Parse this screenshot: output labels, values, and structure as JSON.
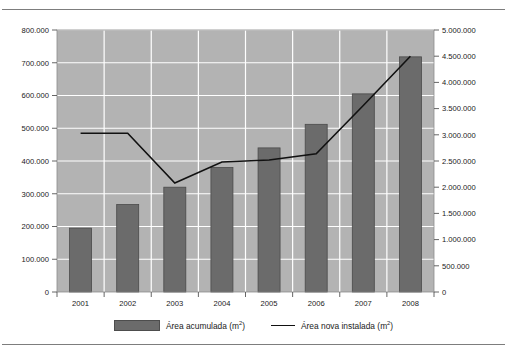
{
  "chart_data": {
    "type": "bar",
    "title": "",
    "subtitle": "",
    "xlabel": "",
    "ylabel": "",
    "grid": true,
    "legend_position": "bottom",
    "categories": [
      "2001",
      "2002",
      "2003",
      "2004",
      "2005",
      "2006",
      "2007",
      "2008"
    ],
    "series": [
      {
        "name": "Área acumulada (m²)",
        "type": "bar",
        "axis": "left",
        "color": "#6b6b6b",
        "values": [
          195000,
          267000,
          320000,
          380000,
          440000,
          512000,
          605000,
          718000
        ]
      },
      {
        "name": "Área nova instalada (m²)",
        "type": "line",
        "axis": "right",
        "color": "#111111",
        "values": [
          3030000,
          3030000,
          2080000,
          2480000,
          2520000,
          2640000,
          3560000,
          4500000
        ]
      }
    ],
    "left_axis": {
      "min": 0,
      "max": 800000,
      "step": 100000,
      "ticks": [
        "0",
        "100.000",
        "200.000",
        "300.000",
        "400.000",
        "500.000",
        "600.000",
        "700.000",
        "800.000"
      ]
    },
    "right_axis": {
      "min": 0,
      "max": 5000000,
      "step": 500000,
      "ticks": [
        "0",
        "500.000",
        "1.000.000",
        "1.500.000",
        "2.000.000",
        "2.500.000",
        "3.000.000",
        "3.500.000",
        "4.000.000",
        "4.500.000",
        "5.000.000"
      ]
    },
    "plot_background": "#b3b3b3",
    "gridline_color": "#ffffff"
  },
  "legend": {
    "entries": [
      {
        "label_prefix": "Área acumulada (m",
        "label_sup": "2",
        "label_suffix": ")",
        "marker": "bar-swatch"
      },
      {
        "label_prefix": "Área nova instalada (m",
        "label_sup": "2",
        "label_suffix": ")",
        "marker": "line-swatch"
      }
    ]
  }
}
